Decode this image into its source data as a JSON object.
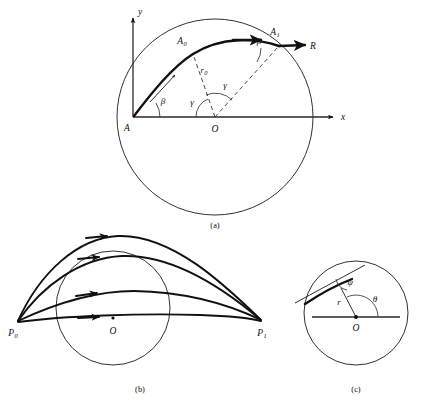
{
  "figure": {
    "caption_panels": [
      {
        "key": "a",
        "label": "(a)"
      },
      {
        "key": "b",
        "label": "(b)"
      },
      {
        "key": "c",
        "label": "(c)"
      }
    ],
    "colors": {
      "ink": "#111111",
      "line": "#333333",
      "background": "#ffffff"
    }
  },
  "panel_a": {
    "name": "elliptic-trajectory-with-central-angles",
    "axes": {
      "x_label": "x",
      "y_label": "y"
    },
    "points": [
      {
        "id": "A",
        "label": "A",
        "sub": "",
        "x": 133,
        "y": 117
      },
      {
        "id": "A0",
        "label": "A",
        "sub": "0",
        "x": 192,
        "y": 52
      },
      {
        "id": "A1",
        "label": "A",
        "sub": "1",
        "x": 279,
        "y": 46
      },
      {
        "id": "O",
        "label": "O",
        "sub": "",
        "x": 215,
        "y": 117
      }
    ],
    "vector_label": "R",
    "radius_label": {
      "text": "r",
      "sub": "0"
    },
    "angles": [
      {
        "id": "beta-launch",
        "label": "β",
        "vertex": "A"
      },
      {
        "id": "beta-impact",
        "label": "β",
        "vertex": "A1"
      },
      {
        "id": "gamma-left",
        "label": "γ",
        "vertex": "O"
      },
      {
        "id": "gamma-right",
        "label": "γ",
        "vertex": "O"
      }
    ],
    "circle": {
      "cx": 215,
      "cy": 117,
      "r": 98
    }
  },
  "panel_b": {
    "name": "family-of-trajectories-between-two-points",
    "points": [
      {
        "id": "P0",
        "label": "P",
        "sub": "0",
        "x": 17,
        "y": 322
      },
      {
        "id": "O",
        "label": "O",
        "sub": "",
        "x": 113,
        "y": 322
      },
      {
        "id": "P1",
        "label": "P",
        "sub": "1",
        "x": 262,
        "y": 322
      }
    ],
    "circle": {
      "cx": 113,
      "cy": 308,
      "r": 57
    },
    "trajectory_count": 4
  },
  "panel_c": {
    "name": "polar-coordinates-and-flight-path-angle",
    "points": [
      {
        "id": "O",
        "label": "O",
        "x": 356,
        "y": 317
      }
    ],
    "circle": {
      "cx": 356,
      "cy": 313,
      "r": 52
    },
    "labels": {
      "radius": "r",
      "psi": "ψ",
      "theta": "θ"
    }
  }
}
